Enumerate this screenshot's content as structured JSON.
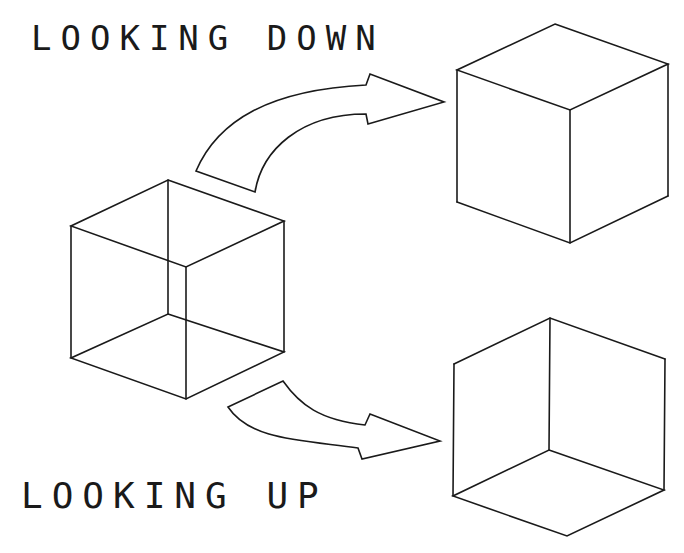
{
  "labels": {
    "looking_down": "LOOKING DOWN",
    "looking_up": "LOOKING UP"
  },
  "figures": {
    "center_cube": {
      "description": "wireframe Necker cube (ambiguous)",
      "edges": 12
    },
    "top_right_cube": {
      "description": "cube viewed from above, top face visible"
    },
    "bottom_right_cube": {
      "description": "cube viewed from below, bottom face visible"
    },
    "arrow_up": {
      "description": "curved arrow from center cube to top-right cube"
    },
    "arrow_down": {
      "description": "curved arrow from center cube to bottom-right cube"
    }
  },
  "colors": {
    "line": "#1a1a1a",
    "background": "#ffffff"
  }
}
